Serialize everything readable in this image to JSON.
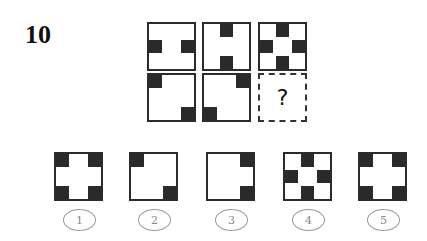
{
  "question": {
    "number": "10",
    "missing_mark": "?"
  },
  "sequence": [
    {
      "row": 1,
      "col": 1,
      "cells": [
        "ml",
        "mr"
      ]
    },
    {
      "row": 1,
      "col": 2,
      "cells": [
        "tc",
        "bc"
      ]
    },
    {
      "row": 1,
      "col": 3,
      "cells": [
        "tc",
        "ml",
        "mr",
        "bc"
      ]
    },
    {
      "row": 2,
      "col": 1,
      "cells": [
        "tl",
        "br"
      ]
    },
    {
      "row": 2,
      "col": 2,
      "cells": [
        "tr",
        "bl"
      ]
    },
    {
      "row": 2,
      "col": 3,
      "cells": [],
      "missing": true
    }
  ],
  "options": [
    {
      "label": "1",
      "cells": [
        "tl",
        "tr",
        "bl",
        "br"
      ]
    },
    {
      "label": "2",
      "cells": [
        "tl",
        "br"
      ]
    },
    {
      "label": "3",
      "cells": [
        "tr",
        "br"
      ]
    },
    {
      "label": "4",
      "cells": [
        "tc",
        "ml",
        "mr",
        "bc"
      ]
    },
    {
      "label": "5",
      "cells": [
        "tl",
        "tr",
        "bl",
        "br"
      ]
    }
  ],
  "colors": {
    "cell_fill": "#2a2a2a",
    "border": "#2b2b2b",
    "option_circle": "#999999"
  }
}
